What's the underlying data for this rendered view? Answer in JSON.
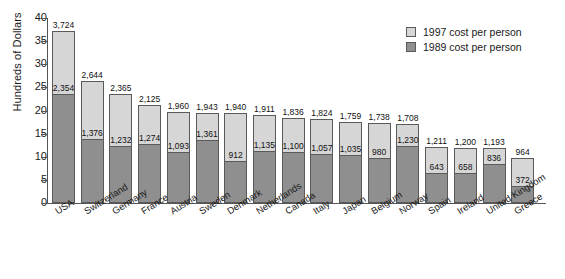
{
  "chart_data": {
    "type": "bar",
    "subtype": "stacked-overlay",
    "title": "",
    "subtitle": "",
    "xlabel": "",
    "ylabel": "Hundreds of Dollars",
    "ylim": [
      0,
      40
    ],
    "yticks": [
      0,
      5,
      10,
      15,
      20,
      25,
      30,
      35,
      40
    ],
    "ytick_labels": [
      "0",
      "5",
      "10",
      "15",
      "20",
      "25",
      "30",
      "35",
      "40"
    ],
    "grid": false,
    "legend_position": "top-right",
    "units_note": "Bar heights are in hundreds of dollars; data labels show dollars per person.",
    "categories": [
      "USA",
      "Switzerland",
      "Germany",
      "France",
      "Austria",
      "Sweden",
      "Denmark",
      "Netherlands",
      "Canada",
      "Italy",
      "Japan",
      "Belgium",
      "Norway",
      "Spain",
      "Ireland",
      "United Kingdom",
      "Greece"
    ],
    "series": [
      {
        "name": "1997 cost per person",
        "color": "#d6d6d6",
        "values": [
          3724,
          2644,
          2365,
          2125,
          1960,
          1943,
          1940,
          1911,
          1836,
          1824,
          1759,
          1738,
          1708,
          1211,
          1200,
          1193,
          964
        ],
        "labels": [
          "3,724",
          "2,644",
          "2,365",
          "2,125",
          "1,960",
          "1,943",
          "1,940",
          "1,911",
          "1,836",
          "1,824",
          "1,759",
          "1,738",
          "1,708",
          "1,211",
          "1,200",
          "1,193",
          "964"
        ]
      },
      {
        "name": "1989 cost per person",
        "color": "#8f8f8f",
        "values": [
          2354,
          1376,
          1232,
          1274,
          1093,
          1361,
          912,
          1135,
          1100,
          1057,
          1035,
          980,
          1230,
          643,
          658,
          836,
          372
        ],
        "labels": [
          "2,354",
          "1,376",
          "1,232",
          "1,274",
          "1,093",
          "1,361",
          "912",
          "1,135",
          "1,100",
          "1,057",
          "1,035",
          "980",
          "1,230",
          "643",
          "658",
          "836",
          "372"
        ]
      }
    ],
    "legend": [
      {
        "label": "1997 cost per person",
        "color": "#d6d6d6"
      },
      {
        "label": "1989 cost per person",
        "color": "#8f8f8f"
      }
    ]
  }
}
